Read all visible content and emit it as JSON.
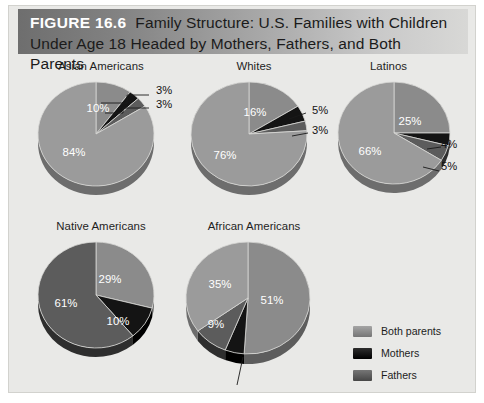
{
  "figure": {
    "number": "FIGURE 16.6",
    "title": "Family Structure: U.S. Families with Children Under Age 18 Headed by Mothers, Fathers, and Both Parents"
  },
  "legend": {
    "items": [
      {
        "label": "Both parents",
        "color": "#8b8b8b",
        "key": "both"
      },
      {
        "label": "Mothers",
        "color": "#141414",
        "key": "mothers"
      },
      {
        "label": "Fathers",
        "color": "#5c5c5c",
        "key": "fathers"
      },
      {
        "label": "Neither parent",
        "color": "#9b9b9b",
        "key": "neither"
      }
    ]
  },
  "chart_data": {
    "type": "pie",
    "title": "Family Structure: U.S. Families with Children Under Age 18 Headed by Mothers, Fathers, and Both Parents",
    "units": "percent",
    "categories": [
      "Both parents",
      "Mothers",
      "Fathers",
      "Neither parent"
    ],
    "colors": [
      "#8b8b8b",
      "#141414",
      "#5c5c5c",
      "#9b9b9b"
    ],
    "legend_position": "right-middle",
    "charts": [
      {
        "name": "Asian Americans",
        "values": [
          84,
          10,
          3,
          3
        ],
        "labels": [
          "84%",
          "10%",
          "3%",
          "3%"
        ],
        "inside_labels": [
          "84%",
          "10%"
        ],
        "callout_labels": [
          "3%",
          "3%"
        ]
      },
      {
        "name": "Whites",
        "values": [
          76,
          16,
          5,
          3
        ],
        "labels": [
          "76%",
          "16%",
          "5%",
          "3%"
        ],
        "inside_labels": [
          "76%",
          "16%"
        ],
        "callout_labels": [
          "5%",
          "3%"
        ]
      },
      {
        "name": "Latinos",
        "values": [
          66,
          25,
          4,
          5
        ],
        "labels": [
          "66%",
          "25%",
          "4%",
          "5%"
        ],
        "inside_labels": [
          "66%",
          "25%"
        ],
        "callout_labels": [
          "4%",
          "5%"
        ]
      },
      {
        "name": "Native Americans",
        "values": [
          61,
          29,
          10,
          0
        ],
        "labels": [
          "61%",
          "29%",
          "10%",
          ""
        ],
        "inside_labels": [
          "61%",
          "29%",
          "10%"
        ],
        "callout_labels": []
      },
      {
        "name": "African Americans",
        "values": [
          35,
          51,
          9,
          5
        ],
        "labels": [
          "35%",
          "51%",
          "9%",
          "5%"
        ],
        "inside_labels": [
          "35%",
          "51%",
          "9%"
        ],
        "callout_labels": [
          "5%"
        ]
      }
    ]
  },
  "panels": {
    "asian": {
      "title": "Asian Americans"
    },
    "whites": {
      "title": "Whites"
    },
    "latinos": {
      "title": "Latinos"
    },
    "native": {
      "title": "Native Americans"
    },
    "african": {
      "title": "African Americans"
    }
  },
  "callouts": {
    "asian_a": "3%",
    "asian_b": "3%",
    "whites_a": "5%",
    "whites_b": "3%",
    "latinos_a": "4%",
    "latinos_b": "5%",
    "african_a": "5%"
  }
}
